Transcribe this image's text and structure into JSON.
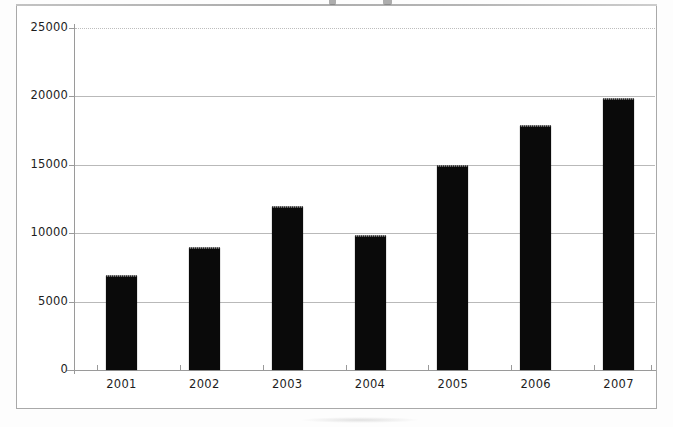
{
  "chart_data": {
    "type": "bar",
    "title": "",
    "xlabel": "",
    "ylabel": "",
    "categories": [
      "2001",
      "2002",
      "2003",
      "2004",
      "2005",
      "2006",
      "2007"
    ],
    "values": [
      6900,
      8900,
      11900,
      9800,
      14900,
      17800,
      19800
    ],
    "series": [
      {
        "name": "",
        "values": [
          6900,
          8900,
          11900,
          9800,
          14900,
          17800,
          19800
        ]
      }
    ],
    "ylim": [
      0,
      25000
    ],
    "ytick_labels": [
      "0",
      "5000",
      "10000",
      "15000",
      "20000",
      "25000"
    ],
    "ytick_values": [
      0,
      5000,
      10000,
      15000,
      20000,
      25000
    ],
    "grid": "horizontal",
    "legend": "none",
    "bar_color": "#0a0a0a",
    "gridline_color": "#b9b9b9",
    "axis_color": "#9a9a9a",
    "frame_color": "#a9a9a9",
    "background_color": "#ffffff"
  }
}
